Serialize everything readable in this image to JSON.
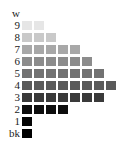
{
  "chart_data": {
    "type": "heatmap",
    "title": "",
    "rows": [
      {
        "label": "w",
        "count": 0,
        "color": "#ffffff"
      },
      {
        "label": "9",
        "count": 2,
        "color": "#e6e6e6"
      },
      {
        "label": "8",
        "count": 3,
        "color": "#c9c9c9"
      },
      {
        "label": "7",
        "count": 5,
        "color": "#a8a8a8"
      },
      {
        "label": "6",
        "count": 6,
        "color": "#8c8c8c"
      },
      {
        "label": "5",
        "count": 7,
        "color": "#727272"
      },
      {
        "label": "4",
        "count": 8,
        "color": "#5a5a5a"
      },
      {
        "label": "3",
        "count": 7,
        "color": "#3a3a3a"
      },
      {
        "label": "2",
        "count": 4,
        "color": "#0d0d0d"
      },
      {
        "label": "1",
        "count": 1,
        "color": "#050505"
      },
      {
        "label": "bk",
        "count": 1,
        "color": "#000000"
      }
    ]
  }
}
